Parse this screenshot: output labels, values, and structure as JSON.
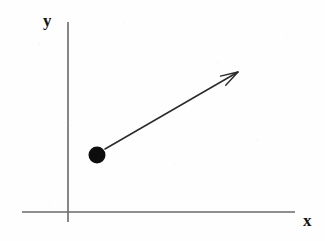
{
  "figure": {
    "background_color": "#fefefe"
  },
  "axes": {
    "color": "#6a6a6a",
    "stroke_width": 1.6,
    "origin": {
      "x": 68,
      "y": 212
    },
    "y_axis": {
      "label": "y",
      "x": 68,
      "y_top": 22,
      "y_bottom": 222
    },
    "x_axis": {
      "label": "x",
      "y": 212,
      "x_left": 22,
      "x_right": 295
    }
  },
  "labels": {
    "y_label": "y",
    "x_label": "x",
    "color": "#141414"
  },
  "point": {
    "name": "particle",
    "center_x": 97,
    "center_y": 155,
    "radius": 8.5,
    "color": "#0d0d0d"
  },
  "vector": {
    "name": "velocity-vector",
    "start_x": 105,
    "start_y": 149,
    "tip_x": 238,
    "tip_y": 72,
    "color": "#2b2b2b",
    "stroke_width": 1.5,
    "arrowhead_style": "open-v",
    "arrowhead_length": 18,
    "arrowhead_half_angle_deg": 17
  }
}
